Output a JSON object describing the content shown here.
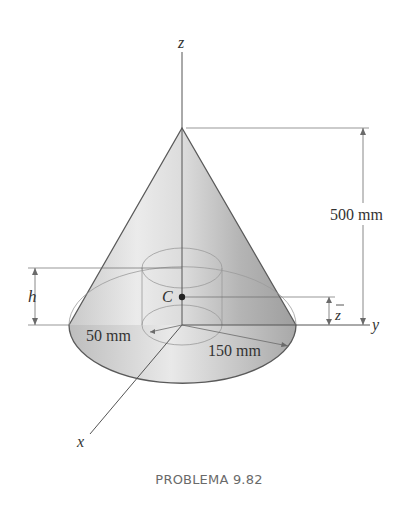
{
  "figure": {
    "axes": {
      "z_label": "z",
      "y_label": "y",
      "x_label": "x"
    },
    "dimensions": {
      "height_total": "500 mm",
      "inner_radius": "50 mm",
      "outer_radius": "150 mm",
      "hole_depth_label": "h",
      "centroid_height_label": "z"
    },
    "centroid_label": "C",
    "colors": {
      "cone_light": "#e6e6e6",
      "cone_dark": "#9a9a9a",
      "line": "#555555",
      "thin_line": "#8a8a8a"
    }
  },
  "caption": "PROBLEMA 9.82"
}
